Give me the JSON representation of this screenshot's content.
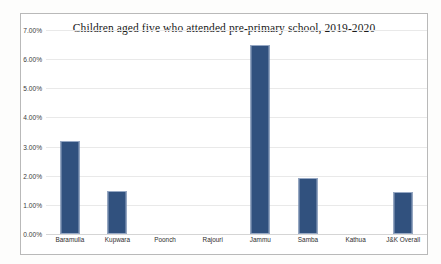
{
  "chart_data": {
    "type": "bar",
    "title": "Children aged five who attended pre-primary school, 2019-2020",
    "xlabel": "",
    "ylabel": "",
    "categories": [
      "Baramulla",
      "Kupwara",
      "Poonch",
      "Rajouri",
      "Jammu",
      "Samba",
      "Kathua",
      "J&K Overall"
    ],
    "values": [
      3.18,
      1.48,
      0.0,
      0.0,
      6.48,
      1.93,
      0.0,
      1.44
    ],
    "value_labels": [
      "3.18%",
      "1.48%",
      "0.00%",
      "0.00%",
      "6.48%",
      "1.93%",
      "0.00%",
      "1.44%"
    ],
    "ylim": [
      0,
      7
    ],
    "ytick_values": [
      0,
      1,
      2,
      3,
      4,
      5,
      6,
      7
    ],
    "ytick_labels": [
      "0.00%",
      "1.00%",
      "2.00%",
      "3.00%",
      "4.00%",
      "5.00%",
      "6.00%",
      "7.00%"
    ],
    "grid": true,
    "legend": false,
    "legend_position": "none",
    "series_color": "#31517E",
    "gridline_color": "#E9E9E9",
    "bar_border_color": "#96A8C4"
  },
  "frame": {
    "border_color": "#B9B9B9",
    "background": "#FFFFFF"
  }
}
